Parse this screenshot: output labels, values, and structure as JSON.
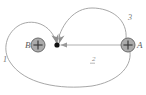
{
  "figure": {
    "background_color": "#ffffff",
    "curve_color": "#9a9a9a",
    "arrow_color": "#8f8f8f",
    "charge_body_color": "#a8a8a8",
    "charge_edge_color": "#6b6b6b",
    "point_color": "#111111",
    "label_color": "#6f6f6f",
    "width": 146,
    "height": 95
  },
  "charges": [
    {
      "id": "charge-b",
      "label": "B",
      "sign": "+",
      "label_side": "left",
      "cx": 38,
      "cy": 45,
      "r": 7
    },
    {
      "id": "charge-a",
      "label": "A",
      "sign": "+",
      "label_side": "right",
      "cx": 128,
      "cy": 45,
      "r": 7
    }
  ],
  "field_point": {
    "id": "field-point",
    "label": "",
    "cx": 57,
    "cy": 45,
    "r": 2.6
  },
  "paths": [
    {
      "id": "path-1",
      "label": "1",
      "label_x": 3,
      "label_y": 62,
      "description": "outer loop from field point sweeping left around B, down and far right to A",
      "d": "M 57 45 C 52 22, 30 18, 18 26 C 6 34, 2 50, 10 62 C 24 84, 60 90, 92 86 C 116 82, 132 68, 130 52"
    },
    {
      "id": "path-2",
      "label": "2",
      "label_x": 92,
      "label_y": 61,
      "description": "straight horizontal segment from A leftward to the field point",
      "d": "M 121 45 L 61 45",
      "straight": true
    },
    {
      "id": "path-3",
      "label": "3",
      "label_x": 128,
      "label_y": 20,
      "description": "arc rising from A up over the top and down into the field point",
      "d": "M 126 39 C 128 20, 112 8, 92 8 C 74 8, 62 24, 58 40"
    }
  ],
  "arrowheads": [
    {
      "id": "arrowhead-path-1",
      "target": "field-point",
      "direction": "down-right"
    },
    {
      "id": "arrowhead-path-3",
      "target": "field-point",
      "direction": "down-left"
    },
    {
      "id": "arrowhead-path-2",
      "target": "field-point",
      "direction": "left"
    }
  ]
}
